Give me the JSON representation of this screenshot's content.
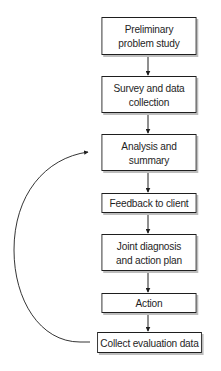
{
  "diagram": {
    "type": "flowchart",
    "direction": "top-to-bottom",
    "colors": {
      "stroke": "#1e1e1e",
      "shadow": "#bdbdbd",
      "background": "#ffffff"
    },
    "nodes": [
      {
        "id": "n1",
        "label": "Preliminary\nproblem study"
      },
      {
        "id": "n2",
        "label": "Survey and data\ncollection"
      },
      {
        "id": "n3",
        "label": "Analysis and\nsummary"
      },
      {
        "id": "n4",
        "label": "Feedback to client"
      },
      {
        "id": "n5",
        "label": "Joint diagnosis\nand action plan"
      },
      {
        "id": "n6",
        "label": "Action"
      },
      {
        "id": "n7",
        "label": "Collect evaluation data"
      }
    ],
    "edges": [
      {
        "from": "n1",
        "to": "n2"
      },
      {
        "from": "n2",
        "to": "n3"
      },
      {
        "from": "n3",
        "to": "n4"
      },
      {
        "from": "n4",
        "to": "n5"
      },
      {
        "from": "n5",
        "to": "n6"
      },
      {
        "from": "n6",
        "to": "n7"
      },
      {
        "from": "n7",
        "to": "n3",
        "style": "curved-loop-left"
      }
    ]
  }
}
